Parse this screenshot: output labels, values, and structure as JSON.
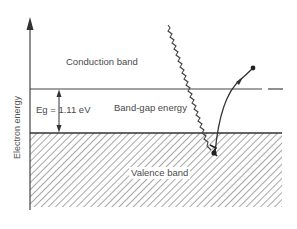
{
  "diagram": {
    "y_axis_label": "Electron energy",
    "labels": {
      "conduction_band": "Conduction band",
      "band_gap_energy": "Band-gap energy",
      "valence_band": "Valence band",
      "eg_value": "Eg = 1.11 eV"
    },
    "elements": {
      "photon": "wavy line (incoming photon)",
      "electron_path": "curved arrow from valence band to conduction band",
      "electron": "dot (excited electron)",
      "hole": "dot in valence band"
    },
    "colors": {
      "line": "#333333",
      "hatch": "#6a6a6a",
      "text": "#4a4a4a",
      "background": "#ffffff"
    }
  }
}
